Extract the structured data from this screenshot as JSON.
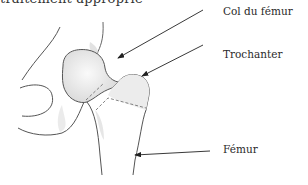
{
  "header": {
    "clipped_text": "traitement approprié"
  },
  "diagram": {
    "labels": [
      {
        "id": "col",
        "text": "Col du fémur"
      },
      {
        "id": "trochanter",
        "text": "Trochanter"
      },
      {
        "id": "femur",
        "text": "Fémur"
      }
    ]
  }
}
